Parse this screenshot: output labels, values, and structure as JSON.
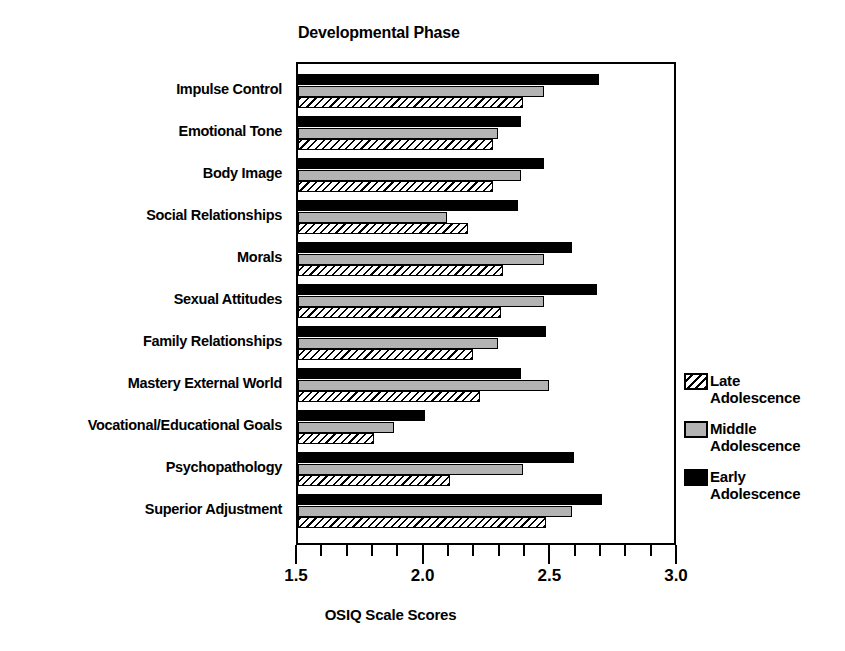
{
  "chart_data": {
    "type": "bar",
    "orientation": "horizontal",
    "title": "Developmental Phase",
    "xlabel": "OSIQ Scale Scores",
    "ylabel": "",
    "xlim": [
      1.5,
      3.0
    ],
    "xticks": [
      "1.5",
      "2.0",
      "2.5",
      "3.0"
    ],
    "xtick_values": [
      1.5,
      2.0,
      2.5,
      3.0
    ],
    "minor_tick_step": 0.1,
    "grid": false,
    "legend_position": "right",
    "categories": [
      "Impulse Control",
      "Emotional Tone",
      "Body Image",
      "Social Relationships",
      "Morals",
      "Sexual Attitudes",
      "Family Relationships",
      "Mastery External World",
      "Vocational/Educational Goals",
      "Psychopathology",
      "Superior Adjustment"
    ],
    "series": [
      {
        "name": "Early Adolescence",
        "legend_line1": "Early",
        "legend_line2": "Adolescence",
        "pattern": "solid-black",
        "color": "#000000",
        "values": [
          2.69,
          2.38,
          2.47,
          2.37,
          2.58,
          2.68,
          2.48,
          2.38,
          2.0,
          2.59,
          2.7
        ]
      },
      {
        "name": "Middle Adolescence",
        "legend_line1": "Middle",
        "legend_line2": "Adolescence",
        "pattern": "solid-gray",
        "color": "#b3b3b3",
        "values": [
          2.47,
          2.29,
          2.38,
          2.09,
          2.47,
          2.47,
          2.29,
          2.49,
          1.88,
          2.39,
          2.58
        ]
      },
      {
        "name": "Late Adolescence",
        "legend_line1": "Late",
        "legend_line2": "Adolescence",
        "pattern": "diagonal-hatch",
        "color": "#ffffff",
        "values": [
          2.39,
          2.27,
          2.27,
          2.17,
          2.31,
          2.3,
          2.19,
          2.22,
          1.8,
          2.1,
          2.48
        ]
      }
    ]
  }
}
